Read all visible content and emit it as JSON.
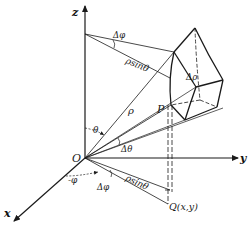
{
  "figure": {
    "axes": {
      "z": "z",
      "y": "y",
      "x": "x"
    },
    "origin_label": "O",
    "point_P": "P",
    "point_Q": "Q(x,y)",
    "labels": {
      "delta_phi_top": "Δφ",
      "rho_sin_theta_top": "ρsinθ",
      "delta_rho": "Δρ",
      "rho": "ρ",
      "theta": "θ",
      "delta_theta": "Δθ",
      "neg_phi": "-φ",
      "delta_phi_bottom": "Δφ",
      "rho_sin_theta_bottom": "ρsinθ"
    },
    "colors": {
      "ink": "#1a1a1a",
      "background": "#ffffff"
    }
  }
}
